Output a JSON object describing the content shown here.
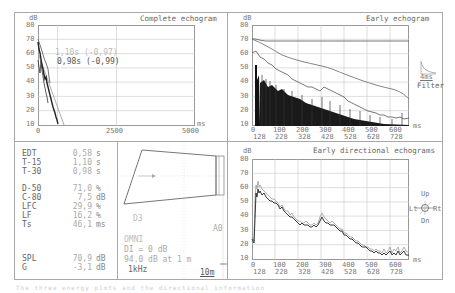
{
  "panels": {
    "complete_echogram": {
      "title": "Complete echogram",
      "y_unit": "dB",
      "x_unit": "ms",
      "y_ticks": [
        "80",
        "70",
        "60",
        "50",
        "40",
        "30",
        "20",
        "10"
      ],
      "x_ticks": [
        "0",
        "2500",
        "5000"
      ],
      "annotation_1": "1,10s (-0,97)",
      "annotation_2": "0,98s (-0,99)"
    },
    "early_echogram": {
      "title": "Early echogram",
      "y_unit": "dB",
      "x_unit": "ms",
      "y_ticks": [
        "80",
        "70",
        "60",
        "50",
        "40",
        "30",
        "20",
        "10"
      ],
      "x_ticks": [
        "0",
        "100",
        "200",
        "300",
        "400",
        "500",
        "600"
      ],
      "x_ticks_2": [
        "128",
        "228",
        "328",
        "428",
        "528",
        "628",
        "728"
      ],
      "filter_label": "4ms",
      "filter_caption": "Filter"
    },
    "early_directional": {
      "title": "Early directional echograms",
      "y_unit": "dB",
      "x_unit": "ms",
      "y_ticks": [
        "80",
        "70",
        "60",
        "50",
        "40",
        "30",
        "20",
        "10"
      ],
      "x_ticks": [
        "0",
        "100",
        "200",
        "300",
        "400",
        "500",
        "600"
      ],
      "x_ticks_2": [
        "128",
        "228",
        "328",
        "428",
        "528",
        "628",
        "728"
      ],
      "compass": {
        "up": "Up",
        "down": "Dn",
        "left": "Lt",
        "right": "Rt"
      }
    }
  },
  "metrics": [
    {
      "name": "EDT",
      "value": "0,58",
      "unit": "s"
    },
    {
      "name": "T-15",
      "value": "1,10",
      "unit": "s"
    },
    {
      "name": "T-30",
      "value": "0,98",
      "unit": "s"
    },
    {
      "name": "D-50",
      "value": "71,0",
      "unit": "%"
    },
    {
      "name": "C-80",
      "value": "7,5",
      "unit": "dB"
    },
    {
      "name": "LFC",
      "value": "29,9",
      "unit": "%"
    },
    {
      "name": "LF",
      "value": "16,2",
      "unit": "%"
    },
    {
      "name": "Ts",
      "value": "46,1",
      "unit": "ms"
    },
    {
      "name": "SPL",
      "value": "70,9",
      "unit": "dB"
    },
    {
      "name": "G",
      "value": "-3,1",
      "unit": "dB"
    }
  ],
  "room": {
    "source_label": "D3",
    "receiver_label": "A0",
    "source_type": "OMNI",
    "di": "DI = 0 dB",
    "level": "94.0 dB at 1 m",
    "frequency": "1kHz",
    "scale": "10m"
  },
  "caption": "The three energy plots and the directional information"
}
